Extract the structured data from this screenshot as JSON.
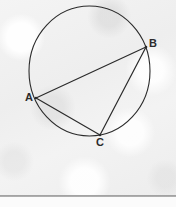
{
  "figure": {
    "kind": "circle-with-inscribed-triangle",
    "background_color": "#f1f1f1",
    "stroke_color": "#2b2b2b",
    "canvas": {
      "width": 176,
      "height": 207
    },
    "circle": {
      "name": "circle",
      "center_x": 89.5,
      "center_y": 71,
      "radius_x": 60.5,
      "radius_y": 65,
      "stroke_width": 1.1
    },
    "points": [
      {
        "id": "A",
        "label": "A",
        "x": 36,
        "y": 98,
        "label_x": 25,
        "label_y": 92
      },
      {
        "id": "B",
        "label": "B",
        "x": 146,
        "y": 47,
        "label_x": 149,
        "label_y": 38
      },
      {
        "id": "C",
        "label": "C",
        "x": 100,
        "y": 135,
        "label_x": 96,
        "label_y": 137
      }
    ],
    "chords": [
      {
        "id": "AB",
        "from": "A",
        "to": "B",
        "x1": 36,
        "y1": 98,
        "x2": 146,
        "y2": 47
      },
      {
        "id": "AC",
        "from": "A",
        "to": "C",
        "x1": 36,
        "y1": 98,
        "x2": 100,
        "y2": 135
      },
      {
        "id": "BC",
        "from": "B",
        "to": "C",
        "x1": 146,
        "y1": 47,
        "x2": 100,
        "y2": 135
      }
    ]
  },
  "footer": {
    "rule_color": "#9c9c9c",
    "background_color": "#fbfbfb"
  }
}
